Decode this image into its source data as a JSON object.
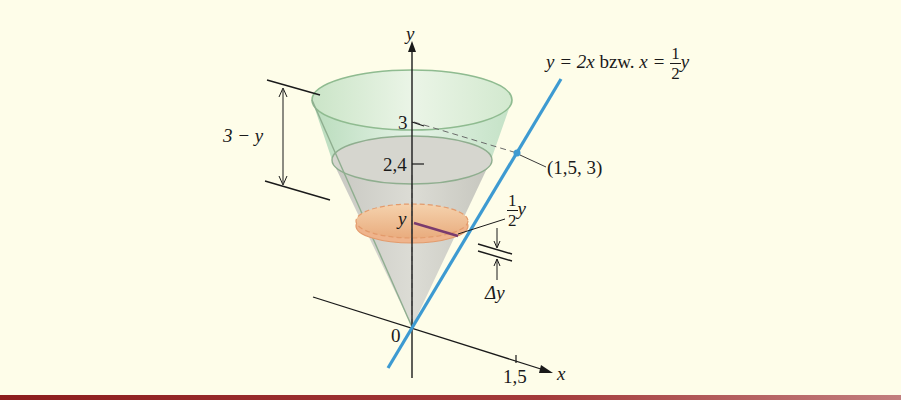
{
  "figure": {
    "axes": {
      "y_label": "y",
      "x_label": "x",
      "origin_label": "0"
    },
    "ticks": {
      "y_top": "3",
      "y_water": "2,4",
      "x_tick": "1,5"
    },
    "line_equation": {
      "lhs": "y = 2x",
      "connector": "bzw.",
      "rhs_var": "x =",
      "frac_num": "1",
      "frac_den": "2",
      "rhs_tail": "y"
    },
    "point_label": "(1,5, 3)",
    "height_label": "3 − y",
    "disk_center_label": "y",
    "radius_label": {
      "frac_num": "1",
      "frac_den": "2",
      "tail": "y"
    },
    "thickness_label": "Δy",
    "colors": {
      "background": "#fefde9",
      "cone_fill_top": "#cfe6cf",
      "cone_edge": "#8fb88f",
      "water_fill": "#cfcfc8",
      "disk_fill": "#f0c49a",
      "disk_edge": "#e39b6c",
      "line_blue": "#3d9ad1",
      "radius_purple": "#7a3b6e",
      "bottom_band": "#8c1d1d"
    }
  }
}
